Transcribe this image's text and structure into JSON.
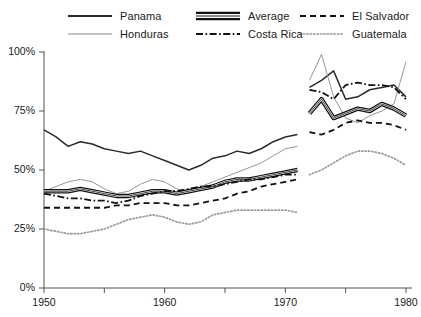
{
  "chart_data": {
    "type": "line",
    "title": "",
    "subtitle": "",
    "xlabel": "",
    "ylabel": "",
    "xlim": [
      1950,
      1980
    ],
    "ylim": [
      0,
      100
    ],
    "y_unit": "%",
    "grid": false,
    "legend_position": "top",
    "note": "Two disjoint data panels: 1950-1971 (left) and 1972-1980 (right); a gap separates them.",
    "x_tick_labels": [
      "1950",
      "1960",
      "1970",
      "1980"
    ],
    "x_tick_values": [
      1950,
      1960,
      1970,
      1980
    ],
    "x_minor_ticks": [
      1955,
      1965,
      1975
    ],
    "y_tick_labels": [
      "0%",
      "25%",
      "50%",
      "75%",
      "100%"
    ],
    "y_tick_values": [
      0,
      25,
      50,
      75,
      100
    ],
    "series": [
      {
        "name": "Panama",
        "style": "solid-medium",
        "color": "#2b2b2b",
        "width": 1.6,
        "segments": [
          {
            "x": [
              1950,
              1951,
              1952,
              1953,
              1954,
              1955,
              1956,
              1957,
              1958,
              1959,
              1960,
              1961,
              1962,
              1963,
              1964,
              1965,
              1966,
              1967,
              1968,
              1969,
              1970,
              1971
            ],
            "y": [
              67,
              64,
              60,
              62,
              61,
              59,
              58,
              57,
              58,
              56,
              54,
              52,
              50,
              52,
              55,
              56,
              58,
              57,
              59,
              62,
              64,
              65
            ]
          },
          {
            "x": [
              1972,
              1973,
              1974,
              1975,
              1976,
              1977,
              1978,
              1979,
              1980
            ],
            "y": [
              85,
              88,
              92,
              80,
              81,
              84,
              85,
              86,
              81
            ]
          }
        ]
      },
      {
        "name": "Honduras",
        "style": "solid-thin",
        "color": "#777777",
        "width": 0.8,
        "segments": [
          {
            "x": [
              1950,
              1951,
              1952,
              1953,
              1954,
              1955,
              1956,
              1957,
              1958,
              1959,
              1960,
              1961,
              1962,
              1963,
              1964,
              1965,
              1966,
              1967,
              1968,
              1969,
              1970,
              1971
            ],
            "y": [
              41,
              43,
              45,
              46,
              45,
              42,
              40,
              41,
              44,
              46,
              45,
              42,
              41,
              43,
              45,
              47,
              49,
              51,
              53,
              56,
              59,
              60
            ]
          },
          {
            "x": [
              1972,
              1973,
              1974,
              1975,
              1976,
              1977,
              1978,
              1979,
              1980
            ],
            "y": [
              88,
              99,
              81,
              72,
              70,
              73,
              75,
              78,
              96
            ]
          }
        ]
      },
      {
        "name": "Average",
        "style": "double-thick",
        "color": "#111111",
        "width": 3.2,
        "segments": [
          {
            "x": [
              1950,
              1951,
              1952,
              1953,
              1954,
              1955,
              1956,
              1957,
              1958,
              1959,
              1960,
              1961,
              1962,
              1963,
              1964,
              1965,
              1966,
              1967,
              1968,
              1969,
              1970,
              1971
            ],
            "y": [
              41,
              41,
              41,
              42,
              41,
              40,
              39,
              39,
              40,
              41,
              41,
              40,
              41,
              42,
              43,
              45,
              46,
              46,
              47,
              48,
              49,
              50
            ]
          },
          {
            "x": [
              1972,
              1973,
              1974,
              1975,
              1976,
              1977,
              1978,
              1979,
              1980
            ],
            "y": [
              74,
              80,
              72,
              74,
              76,
              75,
              78,
              76,
              73
            ]
          }
        ]
      },
      {
        "name": "Costa Rica",
        "style": "dash-dot",
        "color": "#111111",
        "width": 1.8,
        "segments": [
          {
            "x": [
              1950,
              1951,
              1952,
              1953,
              1954,
              1955,
              1956,
              1957,
              1958,
              1959,
              1960,
              1961,
              1962,
              1963,
              1964,
              1965,
              1966,
              1967,
              1968,
              1969,
              1970,
              1971
            ],
            "y": [
              40,
              39,
              38,
              38,
              37,
              37,
              36,
              37,
              39,
              40,
              41,
              41,
              42,
              43,
              43,
              44,
              45,
              46,
              46,
              47,
              48,
              48
            ]
          },
          {
            "x": [
              1972,
              1973,
              1974,
              1975,
              1976,
              1977,
              1978,
              1979,
              1980
            ],
            "y": [
              84,
              83,
              80,
              86,
              87,
              86,
              86,
              85,
              80
            ]
          }
        ]
      },
      {
        "name": "El Salvador",
        "style": "dashed",
        "color": "#111111",
        "width": 1.8,
        "segments": [
          {
            "x": [
              1950,
              1951,
              1952,
              1953,
              1954,
              1955,
              1956,
              1957,
              1958,
              1959,
              1960,
              1961,
              1962,
              1963,
              1964,
              1965,
              1966,
              1967,
              1968,
              1969,
              1970,
              1971
            ],
            "y": [
              34,
              34,
              34,
              34,
              34,
              34,
              35,
              35,
              36,
              36,
              36,
              35,
              35,
              36,
              37,
              38,
              40,
              41,
              43,
              44,
              45,
              46
            ]
          },
          {
            "x": [
              1972,
              1973,
              1974,
              1975,
              1976,
              1977,
              1978,
              1979,
              1980
            ],
            "y": [
              66,
              65,
              67,
              70,
              71,
              70,
              70,
              69,
              67
            ]
          }
        ]
      },
      {
        "name": "Guatemala",
        "style": "dotted",
        "color": "#9a9a9a",
        "width": 1.6,
        "segments": [
          {
            "x": [
              1950,
              1951,
              1952,
              1953,
              1954,
              1955,
              1956,
              1957,
              1958,
              1959,
              1960,
              1961,
              1962,
              1963,
              1964,
              1965,
              1966,
              1967,
              1968,
              1969,
              1970,
              1971
            ],
            "y": [
              25,
              24,
              23,
              23,
              24,
              25,
              27,
              29,
              30,
              31,
              30,
              28,
              27,
              28,
              31,
              32,
              33,
              33,
              33,
              33,
              33,
              32
            ]
          },
          {
            "x": [
              1972,
              1973,
              1974,
              1975,
              1976,
              1977,
              1978,
              1979,
              1980
            ],
            "y": [
              48,
              50,
              53,
              56,
              58,
              58,
              57,
              55,
              52
            ]
          }
        ]
      }
    ]
  },
  "legend": {
    "items": [
      {
        "label": "Panama",
        "style": "solid-medium",
        "col": 0,
        "row": 0
      },
      {
        "label": "Average",
        "style": "double-thick",
        "col": 1,
        "row": 0
      },
      {
        "label": "El Salvador",
        "style": "dashed",
        "col": 2,
        "row": 0
      },
      {
        "label": "Honduras",
        "style": "solid-thin",
        "col": 0,
        "row": 1
      },
      {
        "label": "Costa Rica",
        "style": "dash-dot",
        "col": 1,
        "row": 1
      },
      {
        "label": "Guatemala",
        "style": "dotted",
        "col": 2,
        "row": 1
      }
    ]
  },
  "axes": {
    "y_labels": [
      "100%",
      "75%",
      "50%",
      "25%",
      "0%"
    ],
    "x_labels": [
      "1950",
      "1960",
      "1970",
      "1980"
    ]
  },
  "colors": {
    "axis": "#555555",
    "ink": "#1a1a1a",
    "thin_line": "#777777",
    "dotted_line": "#9a9a9a",
    "background": "#ffffff"
  }
}
